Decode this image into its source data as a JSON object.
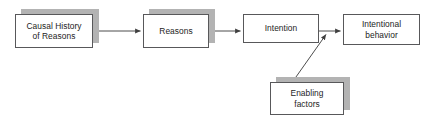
{
  "diagram": {
    "type": "flow-diagram",
    "background_color": "#ffffff",
    "box_border_color": "#58585a",
    "box_fill_color": "#ffffff",
    "shadow_color": "#b3b3b3",
    "arrow_color": "#4d4d4d",
    "text_color": "#1d1d1d",
    "nodes": [
      {
        "id": "causal-history",
        "label": "Causal History\nof Reasons",
        "has_shadow": true
      },
      {
        "id": "reasons",
        "label": "Reasons",
        "has_shadow": true
      },
      {
        "id": "intention",
        "label": "Intention",
        "has_shadow": false
      },
      {
        "id": "intentional-behavior",
        "label": "Intentional\nbehavior",
        "has_shadow": false
      },
      {
        "id": "enabling-factors",
        "label": "Enabling\nfactors",
        "has_shadow": true
      }
    ],
    "edges": [
      {
        "id": "causal-history-to-reasons",
        "from": "causal-history",
        "to": "reasons",
        "style": "straight-arrow"
      },
      {
        "id": "reasons-to-intention",
        "from": "reasons",
        "to": "intention",
        "style": "straight-arrow"
      },
      {
        "id": "intention-to-intentional-behavior",
        "from": "intention",
        "to": "intentional-behavior",
        "style": "straight-arrow"
      },
      {
        "id": "enabling-factors-to-intention-link",
        "from": "enabling-factors",
        "to": "intention-to-intentional-behavior",
        "style": "diagonal-arrow"
      }
    ]
  }
}
